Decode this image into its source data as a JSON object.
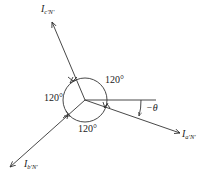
{
  "diagram": {
    "type": "phasor-diagram",
    "center": {
      "x": 85,
      "y": 100
    },
    "circle_radius": 22,
    "line_color": "#333333",
    "phasors": [
      {
        "name": "I_a'N'",
        "base": "I",
        "sub": "a'N'",
        "tip": {
          "x": 180,
          "y": 133
        },
        "label_pos": {
          "x": 183,
          "y": 128
        }
      },
      {
        "name": "I_b'N'",
        "base": "I",
        "sub": "b'N'",
        "tip": {
          "x": 10,
          "y": 167
        },
        "label_pos": {
          "x": 22,
          "y": 158
        }
      },
      {
        "name": "I_c'N'",
        "base": "I",
        "sub": "c'N'",
        "tip": {
          "x": 52,
          "y": 22
        },
        "label_pos": {
          "x": 42,
          "y": 4
        }
      }
    ],
    "reference_line": {
      "x1": 85,
      "y1": 100,
      "x2": 156,
      "y2": 100
    },
    "angle_labels": {
      "top_right": "120°",
      "left": "120°",
      "bottom": "120°",
      "theta": "−θ"
    }
  }
}
